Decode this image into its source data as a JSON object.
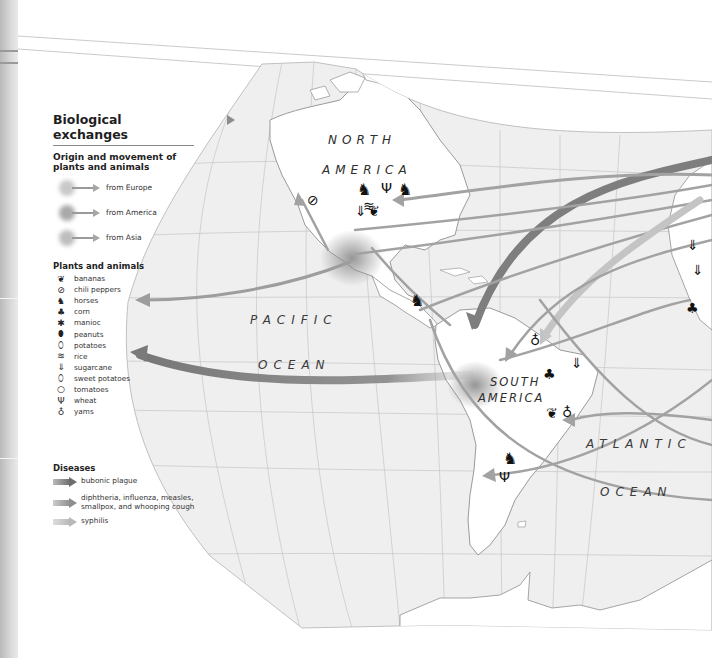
{
  "legend": {
    "title": "Biological exchanges",
    "origin_heading": "Origin and movement of plants and animals",
    "origins": [
      {
        "label": "from Europe",
        "color": "#c8c8c8"
      },
      {
        "label": "from America",
        "color": "#a9a9a9"
      },
      {
        "label": "from Asia",
        "color": "#bdbdbd"
      }
    ],
    "plants_heading": "Plants and animals",
    "plants_animals": [
      {
        "label": "bananas",
        "icon": "banana-icon",
        "glyph": "🍌"
      },
      {
        "label": "chili peppers",
        "icon": "chili-pepper-icon",
        "glyph": "⊘"
      },
      {
        "label": "horses",
        "icon": "horse-icon",
        "glyph": "🐎"
      },
      {
        "label": "corn",
        "icon": "corn-icon",
        "glyph": "♣"
      },
      {
        "label": "manioc",
        "icon": "manioc-icon",
        "glyph": "✱"
      },
      {
        "label": "peanuts",
        "icon": "peanut-icon",
        "glyph": "⬮"
      },
      {
        "label": "potatoes",
        "icon": "potato-icon",
        "glyph": "⬯"
      },
      {
        "label": "rice",
        "icon": "rice-icon",
        "glyph": "≋"
      },
      {
        "label": "sugarcane",
        "icon": "sugarcane-icon",
        "glyph": "⇓"
      },
      {
        "label": "sweet potatoes",
        "icon": "sweet-potato-icon",
        "glyph": "⬯"
      },
      {
        "label": "tomatoes",
        "icon": "tomato-icon",
        "glyph": "ⴰ"
      },
      {
        "label": "wheat",
        "icon": "wheat-icon",
        "glyph": "Ψ"
      },
      {
        "label": "yams",
        "icon": "yam-icon",
        "glyph": "♁"
      }
    ],
    "diseases_heading": "Diseases",
    "diseases": [
      {
        "label": "bubonic plague",
        "color": "#6e6e6e"
      },
      {
        "label": "diphtheria, influenza, measles, smallpox, and whooping cough",
        "color": "#8e8e8e"
      },
      {
        "label": "syphilis",
        "color": "#b8b8b8"
      }
    ]
  },
  "map": {
    "continents": [
      "NORTH",
      "AMERICA",
      "SOUTH",
      "AMERICA"
    ],
    "oceans": [
      "PACIFIC",
      "OCEAN",
      "ATLANTIC",
      "OCEAN"
    ],
    "colors": {
      "land": "#ffffff",
      "sea": "#ececec",
      "coast": "#8f8f8f",
      "grid": "#c4c4c4",
      "arrow": "#9d9d9d",
      "arrow_dark": "#7c7c7c"
    }
  }
}
